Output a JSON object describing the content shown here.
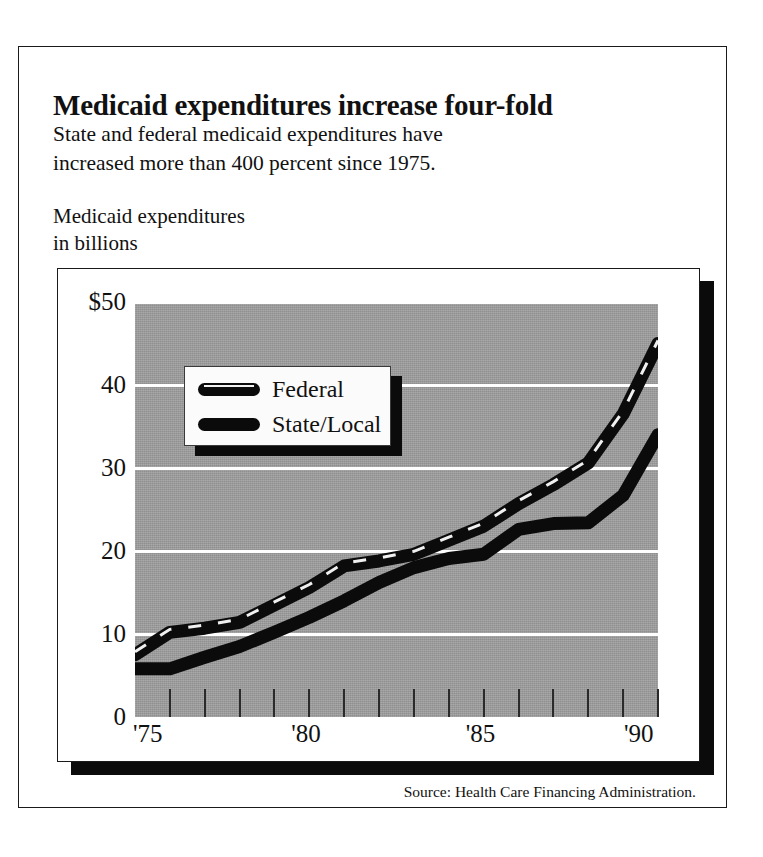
{
  "headline": "Medicaid expenditures increase four-fold",
  "deck": [
    "State and federal medicaid expenditures have",
    "increased more than 400 percent since 1975."
  ],
  "axis_caption": [
    "Medicaid expenditures",
    "in billions"
  ],
  "source_note": "Source:  Health Care Financing Administration.",
  "legend": {
    "items": [
      {
        "label": "Federal",
        "swatch": "dashed-line-swatch",
        "color": "#0b0b0b"
      },
      {
        "label": "State/Local",
        "swatch": "solid-line-swatch",
        "color": "#0b0b0b"
      }
    ]
  },
  "colors": {
    "plot_background": "#9d9d9d",
    "gridline": "#ffffff",
    "line": "#0b0b0b",
    "card_background": "#ffffff",
    "shadow": "#0b0b0b",
    "frame": "#1a1a1a"
  },
  "chart_data": {
    "type": "line",
    "title": "Medicaid expenditures increase four-fold",
    "subtitle": "State and federal medicaid expenditures have increased more than 400 percent since 1975.",
    "ylabel": "Medicaid expenditures in billions",
    "xlabel": "",
    "ylim": [
      0,
      50
    ],
    "yticks": [
      0,
      10,
      20,
      30,
      40,
      50
    ],
    "ytick_labels": [
      "0",
      "10",
      "20",
      "30",
      "40",
      "$50"
    ],
    "grid": true,
    "gridlines_at": [
      10,
      20,
      30,
      40,
      50
    ],
    "legend_position": "upper-left-inset",
    "xlim": [
      1975,
      1990
    ],
    "x": [
      1975,
      1976,
      1977,
      1978,
      1979,
      1980,
      1981,
      1982,
      1983,
      1984,
      1985,
      1986,
      1987,
      1988,
      1989,
      1990
    ],
    "xticks": [
      1975,
      1976,
      1977,
      1978,
      1979,
      1980,
      1981,
      1982,
      1983,
      1984,
      1985,
      1986,
      1987,
      1988,
      1989,
      1990
    ],
    "xtick_labels_shown": [
      "'75",
      "'80",
      "'85",
      "'90"
    ],
    "xtick_labels_shown_at": [
      1975,
      1980,
      1985,
      1990
    ],
    "series": [
      {
        "name": "Federal",
        "style": "dashed",
        "color": "#0b0b0b",
        "values": [
          7.5,
          10.2,
          10.7,
          11.4,
          13.5,
          15.6,
          18.2,
          18.8,
          19.6,
          21.3,
          23.0,
          25.7,
          28.0,
          30.6,
          36.5,
          45.0
        ]
      },
      {
        "name": "State/Local",
        "style": "solid",
        "color": "#0b0b0b",
        "values": [
          5.8,
          5.8,
          7.2,
          8.5,
          10.2,
          12.0,
          14.0,
          16.2,
          18.0,
          19.1,
          19.6,
          22.6,
          23.3,
          23.4,
          26.7,
          34.0
        ]
      }
    ]
  }
}
